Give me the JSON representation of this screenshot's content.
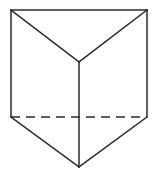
{
  "figure": {
    "type": "line-drawing",
    "description": "Wireframe triangular prism drawn in oblique view, apex pointing toward viewer at bottom, with one hidden edge shown dashed.",
    "canvas": {
      "width": 158,
      "height": 174
    },
    "colors": {
      "background": "#ffffff",
      "stroke": "#2b2b2b"
    },
    "stroke_width": 1.5,
    "dash_pattern": "9 6",
    "vertices": {
      "top_left": {
        "x": 11,
        "y": 10
      },
      "top_right": {
        "x": 147,
        "y": 10
      },
      "front_top_apex": {
        "x": 79,
        "y": 62
      },
      "mid_left": {
        "x": 11,
        "y": 117
      },
      "mid_right": {
        "x": 147,
        "y": 117
      },
      "front_bottom_apex": {
        "x": 79,
        "y": 167
      }
    },
    "edges": [
      {
        "name": "top-back-edge",
        "style": "solid",
        "from": "top_left",
        "to": "top_right"
      },
      {
        "name": "top-face-left-diagonal",
        "style": "solid",
        "from": "top_left",
        "to": "front_top_apex"
      },
      {
        "name": "top-face-right-diagonal",
        "style": "solid",
        "from": "top_right",
        "to": "front_top_apex"
      },
      {
        "name": "left-vertical-edge",
        "style": "solid",
        "from": "top_left",
        "to": "mid_left"
      },
      {
        "name": "right-vertical-edge",
        "style": "solid",
        "from": "top_right",
        "to": "mid_right"
      },
      {
        "name": "front-vertical-edge",
        "style": "solid",
        "from": "front_top_apex",
        "to": "front_bottom_apex"
      },
      {
        "name": "bottom-face-left-diagonal",
        "style": "solid",
        "from": "mid_left",
        "to": "front_bottom_apex"
      },
      {
        "name": "bottom-face-right-diagonal",
        "style": "solid",
        "from": "mid_right",
        "to": "front_bottom_apex"
      },
      {
        "name": "hidden-back-base-edge",
        "style": "dashed",
        "from": "mid_left",
        "to": "mid_right"
      }
    ],
    "labels": []
  }
}
